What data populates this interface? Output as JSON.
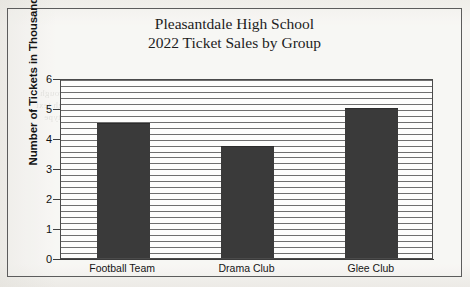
{
  "document": {
    "background_color": "#f6f5f2",
    "frame_color": "#5c5c5c",
    "bleed_through_lines": [
      "the page behind shows faintly through",
      "a second line of reversed show through text",
      "and a third faint reversed line of type"
    ]
  },
  "chart_data": {
    "type": "bar",
    "title": "Pleasantdale High School\n2022 Ticket Sales by Group",
    "title_line_1": "Pleasantdale High School",
    "title_line_2": "2022 Ticket Sales by Group",
    "categories": [
      "Football Team",
      "Drama Club",
      "Glee Club"
    ],
    "values": [
      4.5,
      3.75,
      5.0
    ],
    "xlabel": "",
    "ylabel": "Number of Tickets in Thousands",
    "ylim": [
      0,
      6
    ],
    "ytick_labels": [
      "0",
      "1",
      "2",
      "3",
      "4",
      "5",
      "6"
    ],
    "ytick_values": [
      0,
      1,
      2,
      3,
      4,
      5,
      6
    ],
    "grid": true,
    "grid_orientation": "horizontal",
    "legend": null,
    "bar_color": "#3a3a3a",
    "grid_color": "#6f6f6f",
    "axis_color": "#4a4a4a"
  }
}
